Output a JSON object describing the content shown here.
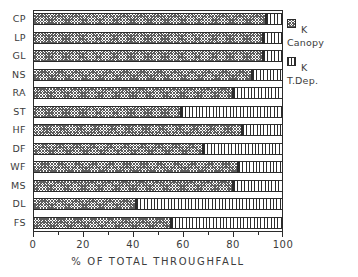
{
  "chart_data": {
    "type": "bar",
    "orientation": "horizontal",
    "stacked": true,
    "title": "",
    "xlabel": "% OF TOTAL THROUGHFALL",
    "ylabel": "",
    "xlim": [
      0,
      100
    ],
    "xticks": [
      0,
      20,
      40,
      60,
      80,
      100
    ],
    "xtick_labels": [
      "0",
      "20",
      "40",
      "60",
      "80",
      "100"
    ],
    "minor_xticks": [
      10,
      30,
      50,
      70,
      90
    ],
    "grid": false,
    "legend_position": "right",
    "categories": [
      "CP",
      "LP",
      "GL",
      "NS",
      "RA",
      "ST",
      "HF",
      "DF",
      "WF",
      "MS",
      "DL",
      "FS"
    ],
    "series": [
      {
        "name": "K Canopy",
        "pattern": "cross-hatch",
        "values": [
          93,
          92,
          92,
          87.5,
          80,
          59,
          83.5,
          68,
          82,
          80,
          41,
          55
        ]
      },
      {
        "name": "K T.Dep.",
        "pattern": "vertical-lines",
        "values": [
          7,
          8,
          8,
          12.5,
          20,
          41,
          16.5,
          32,
          18,
          20,
          59,
          45
        ]
      }
    ]
  },
  "axes": {
    "x_title": "% OF TOTAL THROUGHFALL",
    "x_tick_labels": [
      "0",
      "20",
      "40",
      "60",
      "80",
      "100"
    ],
    "y_tick_labels": [
      "CP",
      "LP",
      "GL",
      "NS",
      "RA",
      "ST",
      "HF",
      "DF",
      "WF",
      "MS",
      "DL",
      "FS"
    ]
  },
  "legend": {
    "entries": [
      {
        "line1": "K",
        "line2": "Canopy",
        "pattern": "cross-hatch"
      },
      {
        "line1": "K",
        "line2": "T.Dep.",
        "pattern": "vertical-lines"
      }
    ]
  },
  "colors": {
    "axis": "#2b2b2b",
    "text": "#3c3c3c",
    "canopy_hatch": "#5d5d5d",
    "tdep_line": "#2b2b2b",
    "background": "#ffffff"
  }
}
